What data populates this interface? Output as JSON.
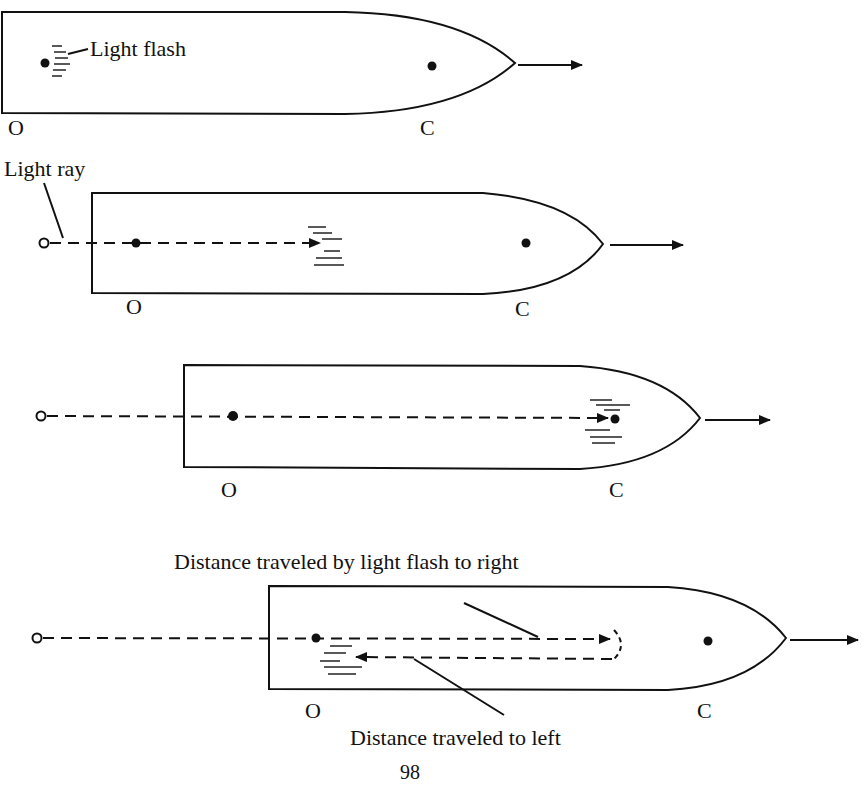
{
  "diagram": {
    "page_number": "98",
    "panels": [
      {
        "id": 1,
        "point_labels": {
          "origin": "O",
          "center": "C"
        },
        "annotation": "Light flash"
      },
      {
        "id": 2,
        "point_labels": {
          "origin": "O",
          "center": "C"
        },
        "annotation": "Light ray"
      },
      {
        "id": 3,
        "point_labels": {
          "origin": "O",
          "center": "C"
        }
      },
      {
        "id": 4,
        "point_labels": {
          "origin": "O",
          "center": "C"
        },
        "annotation_right": "Distance traveled by light flash  to right",
        "annotation_left": "Distance traveled to left"
      }
    ],
    "colors": {
      "ink": "#111111",
      "paper": "#ffffff"
    }
  }
}
